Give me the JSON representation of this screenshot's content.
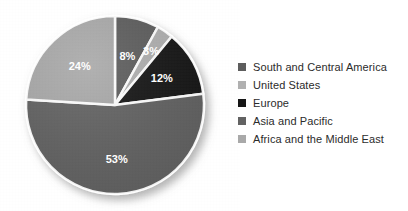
{
  "chart_data": {
    "type": "pie",
    "title": "",
    "subtitle": "",
    "xlabel": "",
    "ylabel": "",
    "grid": false,
    "legend_position": "right",
    "unit": "%",
    "categories": [
      "South and Central America",
      "United States",
      "Europe",
      "Asia and Pacific",
      "Africa and the Middle East"
    ],
    "values": [
      8,
      3,
      12,
      53,
      24
    ],
    "slice_labels": [
      "8%",
      "3%",
      "12%",
      "53%",
      "24%"
    ],
    "colors": [
      "#5d5d5d",
      "#b0b0b0",
      "#161616",
      "#626262",
      "#a9a9a9"
    ],
    "start_angle_deg": 0,
    "direction": "clockwise",
    "slices": [
      {
        "label": "South and Central America",
        "value": 8,
        "display": "8%",
        "color": "#5d5d5d"
      },
      {
        "label": "United States",
        "value": 3,
        "display": "3%",
        "color": "#b0b0b0"
      },
      {
        "label": "Europe",
        "value": 12,
        "display": "12%",
        "color": "#161616"
      },
      {
        "label": "Asia and Pacific",
        "value": 53,
        "display": "53%",
        "color": "#626262"
      },
      {
        "label": "Africa and the Middle East",
        "value": 24,
        "display": "24%",
        "color": "#a9a9a9"
      }
    ]
  },
  "legend": {
    "items": [
      {
        "label": "South and Central America",
        "color": "#5d5d5d"
      },
      {
        "label": "United States",
        "color": "#b0b0b0"
      },
      {
        "label": "Europe",
        "color": "#161616"
      },
      {
        "label": "Asia and Pacific",
        "color": "#626262"
      },
      {
        "label": "Africa and the Middle East",
        "color": "#a9a9a9"
      }
    ]
  },
  "style": {
    "background": "#ffffff",
    "separator_color": "#ffffff",
    "label_text_color": "#ffffff",
    "legend_text_color": "#2b2b2b"
  }
}
